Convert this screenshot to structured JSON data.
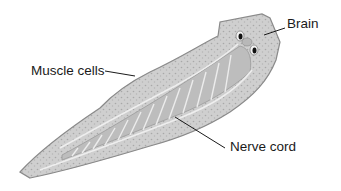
{
  "figure": {
    "labels": {
      "brain": "Brain",
      "muscle_cells": "Muscle cells",
      "nerve_cord": "Nerve cord"
    },
    "colors": {
      "body_fill": "#c9c9c9",
      "body_edge": "#8a8a8a",
      "gut_fill": "#b3b3b3",
      "inner_line": "#eeeeee",
      "leader_line": "#1a1a1a",
      "eyespot": "#111111"
    }
  }
}
